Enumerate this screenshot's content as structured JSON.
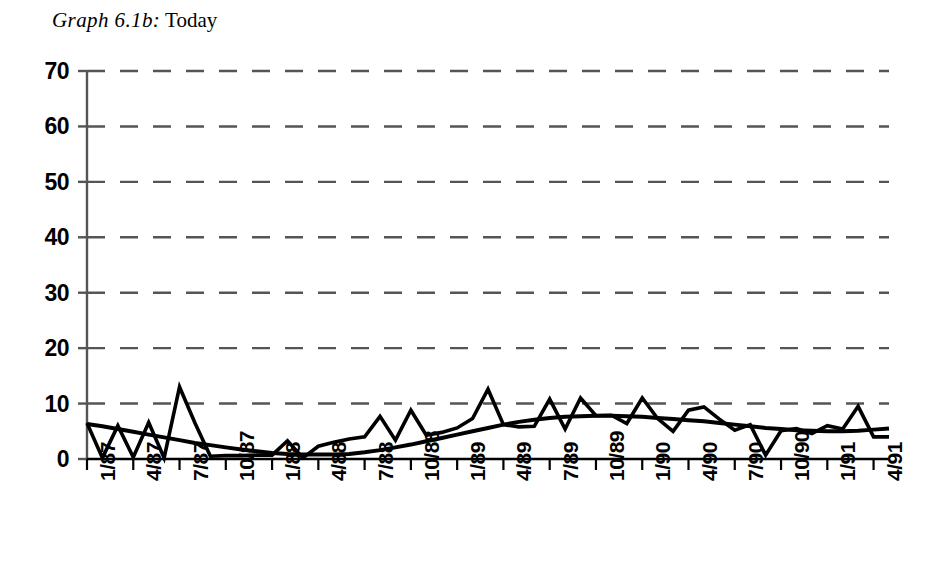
{
  "title": {
    "number": "Graph 6.1b:",
    "label": "Today"
  },
  "chart_data": {
    "type": "line",
    "title": "Graph 6.1b: Today",
    "xlabel": "",
    "ylabel": "",
    "ylim": [
      0,
      70
    ],
    "yticks": [
      0,
      10,
      20,
      30,
      40,
      50,
      60,
      70
    ],
    "grid": true,
    "grid_style": "dashed-horizontal",
    "legend": "none",
    "xtick_labels": [
      "1/87",
      "4/87",
      "7/87",
      "10/87",
      "1/88",
      "4/88",
      "7/88",
      "10/88",
      "1/89",
      "4/89",
      "7/89",
      "10/89",
      "1/90",
      "4/90",
      "7/90",
      "10/90",
      "1/91",
      "4/91"
    ],
    "xtick_interval_months": 3,
    "x_labels_rotation_deg": -90,
    "x": [
      "1/87",
      "2/87",
      "3/87",
      "4/87",
      "5/87",
      "6/87",
      "7/87",
      "8/87",
      "9/87",
      "10/87",
      "11/87",
      "12/87",
      "1/88",
      "2/88",
      "3/88",
      "4/88",
      "5/88",
      "6/88",
      "7/88",
      "8/88",
      "9/88",
      "10/88",
      "11/88",
      "12/88",
      "1/89",
      "2/89",
      "3/89",
      "4/89",
      "5/89",
      "6/89",
      "7/89",
      "8/89",
      "9/89",
      "10/89",
      "11/89",
      "12/89",
      "1/90",
      "2/90",
      "3/90",
      "4/90",
      "5/90",
      "6/90",
      "7/90",
      "8/90",
      "9/90",
      "10/90",
      "11/90",
      "12/90",
      "1/91",
      "2/91",
      "3/91",
      "4/91",
      "5/91"
    ],
    "series": [
      {
        "name": "Today",
        "style": "jagged",
        "values": [
          6.5,
          0.2,
          6.0,
          0.3,
          6.6,
          0.2,
          13.0,
          6.5,
          0.5,
          0.6,
          0.6,
          0.7,
          0.7,
          3.3,
          0.2,
          2.3,
          3.0,
          3.6,
          4.0,
          7.7,
          3.4,
          8.8,
          4.3,
          4.8,
          5.6,
          7.3,
          12.6,
          6.2,
          5.8,
          5.9,
          10.8,
          5.4,
          11.0,
          7.8,
          7.9,
          6.4,
          11.0,
          7.3,
          5.0,
          8.8,
          9.4,
          7.2,
          5.2,
          6.2,
          0.7,
          5.1,
          5.5,
          4.6,
          6.0,
          5.4,
          9.5,
          4.0,
          4.0
        ]
      },
      {
        "name": "Trend",
        "style": "smooth",
        "values": [
          6.3,
          5.9,
          5.4,
          4.9,
          4.4,
          3.9,
          3.4,
          2.9,
          2.5,
          2.1,
          1.7,
          1.4,
          1.1,
          0.9,
          0.8,
          0.8,
          0.8,
          0.9,
          1.2,
          1.6,
          2.1,
          2.6,
          3.2,
          3.8,
          4.4,
          5.0,
          5.6,
          6.2,
          6.7,
          7.1,
          7.4,
          7.6,
          7.7,
          7.8,
          7.8,
          7.7,
          7.6,
          7.4,
          7.2,
          7.0,
          6.8,
          6.5,
          6.2,
          5.9,
          5.6,
          5.4,
          5.2,
          5.1,
          5.0,
          5.0,
          5.1,
          5.3,
          5.5
        ]
      }
    ]
  },
  "style": {
    "axis_color": "#555555",
    "grid_color": "#555555",
    "line_color": "#000000",
    "background": "#ffffff"
  }
}
